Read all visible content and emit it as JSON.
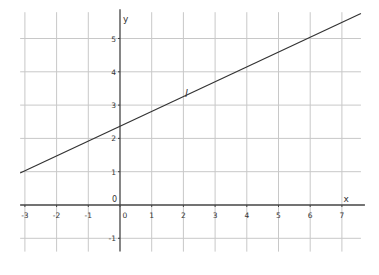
{
  "chart_data": {
    "type": "line",
    "title": "",
    "xlabel": "x",
    "ylabel": "y",
    "origin_label": "0",
    "xlim": [
      -3.15,
      7.6
    ],
    "ylim": [
      -1.4,
      5.7
    ],
    "x_ticks": [
      -3,
      -2,
      -1,
      0,
      1,
      2,
      3,
      4,
      5,
      6,
      7
    ],
    "y_ticks": [
      -1,
      0,
      1,
      2,
      3,
      4,
      5
    ],
    "grid": true,
    "series": [
      {
        "name": "l",
        "label": "l",
        "x": [
          -3.15,
          7.6
        ],
        "y": [
          0.96,
          5.75
        ],
        "slope": 0.45,
        "intercept": 2.35,
        "color": "#333333"
      }
    ]
  },
  "colors": {
    "grid": "#c8c8c8",
    "axis": "#444444",
    "line": "#333333"
  }
}
